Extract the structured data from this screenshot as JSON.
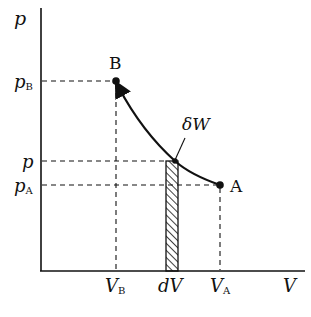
{
  "diagram": {
    "type": "p-V diagram",
    "axes": {
      "y_label": "p",
      "x_label": "V"
    },
    "points": {
      "B": {
        "label": "B"
      },
      "A": {
        "label": "A"
      }
    },
    "pressure_labels": {
      "pB": {
        "main": "p",
        "sub": "B"
      },
      "p": {
        "main": "p",
        "sub": ""
      },
      "pA": {
        "main": "p",
        "sub": "A"
      }
    },
    "volume_labels": {
      "VB": {
        "main": "V",
        "sub": "B"
      },
      "dV": {
        "main": "dV",
        "sub": ""
      },
      "VA": {
        "main": "V",
        "sub": "A"
      }
    },
    "annotation": "δW",
    "colors": {
      "ink": "#111111",
      "background": "#ffffff"
    }
  }
}
